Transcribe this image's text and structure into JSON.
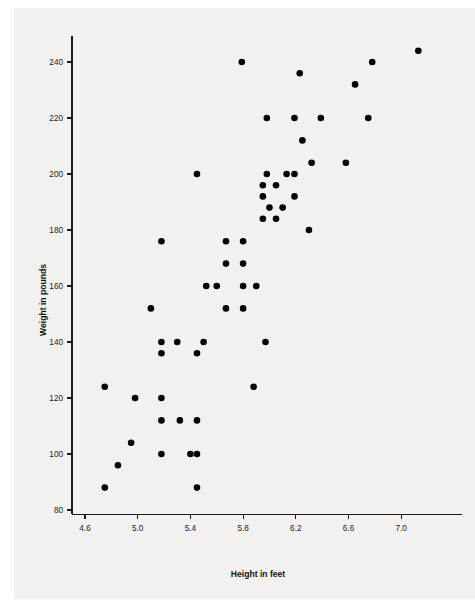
{
  "figure": {
    "background_color": "#f2f1ef",
    "point_color": "#000000",
    "axis_color": "#1a1a1a"
  },
  "axes": {
    "x_title": "Height in feet",
    "y_title": "Weight in pounds",
    "x_ticks": [
      "4.6",
      "5.0",
      "5.4",
      "5.8",
      "6.2",
      "6.6",
      "7.0"
    ],
    "y_ticks": [
      "80",
      "100",
      "120",
      "140",
      "160",
      "180",
      "200",
      "220",
      "240"
    ]
  },
  "chart_data": {
    "type": "scatter",
    "title": "",
    "xlabel": "Height in feet",
    "ylabel": "Weight in pounds",
    "xlim": [
      4.45,
      7.25
    ],
    "ylim": [
      78,
      250
    ],
    "xticks": [
      4.6,
      5.0,
      5.4,
      5.8,
      6.2,
      6.6,
      7.0
    ],
    "yticks": [
      80,
      100,
      120,
      140,
      160,
      180,
      200,
      220,
      240
    ],
    "grid": false,
    "legend": null,
    "series": [
      {
        "name": "Height vs Weight",
        "marker": "filled-circle",
        "color": "#000000",
        "points": [
          [
            4.75,
            88
          ],
          [
            4.75,
            124
          ],
          [
            4.85,
            96
          ],
          [
            4.95,
            104
          ],
          [
            4.98,
            120
          ],
          [
            5.1,
            152
          ],
          [
            5.18,
            100
          ],
          [
            5.18,
            112
          ],
          [
            5.18,
            120
          ],
          [
            5.18,
            136
          ],
          [
            5.18,
            140
          ],
          [
            5.18,
            176
          ],
          [
            5.3,
            140
          ],
          [
            5.32,
            112
          ],
          [
            5.4,
            100
          ],
          [
            5.45,
            88
          ],
          [
            5.45,
            100
          ],
          [
            5.45,
            112
          ],
          [
            5.45,
            136
          ],
          [
            5.45,
            200
          ],
          [
            5.5,
            140
          ],
          [
            5.52,
            160
          ],
          [
            5.6,
            160
          ],
          [
            5.67,
            152
          ],
          [
            5.67,
            168
          ],
          [
            5.67,
            176
          ],
          [
            5.79,
            240
          ],
          [
            5.8,
            152
          ],
          [
            5.8,
            160
          ],
          [
            5.8,
            168
          ],
          [
            5.8,
            176
          ],
          [
            5.88,
            124
          ],
          [
            5.9,
            160
          ],
          [
            5.95,
            184
          ],
          [
            5.95,
            192
          ],
          [
            5.95,
            196
          ],
          [
            5.97,
            140
          ],
          [
            5.98,
            200
          ],
          [
            5.98,
            220
          ],
          [
            6.0,
            188
          ],
          [
            6.05,
            184
          ],
          [
            6.05,
            196
          ],
          [
            6.1,
            188
          ],
          [
            6.13,
            200
          ],
          [
            6.19,
            192
          ],
          [
            6.19,
            200
          ],
          [
            6.19,
            220
          ],
          [
            6.23,
            236
          ],
          [
            6.25,
            212
          ],
          [
            6.3,
            180
          ],
          [
            6.32,
            204
          ],
          [
            6.39,
            220
          ],
          [
            6.58,
            204
          ],
          [
            6.65,
            232
          ],
          [
            6.75,
            220
          ],
          [
            6.78,
            240
          ],
          [
            7.13,
            244
          ]
        ]
      }
    ]
  }
}
